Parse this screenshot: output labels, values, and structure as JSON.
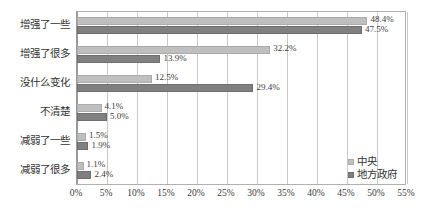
{
  "chart_data": {
    "type": "bar",
    "orientation": "horizontal",
    "title": "",
    "xlabel": "",
    "ylabel": "",
    "categories": [
      "增强了一些",
      "增强了很多",
      "没什么变化",
      "不清楚",
      "减弱了一些",
      "减弱了很多"
    ],
    "series": [
      {
        "name": "中央",
        "color": "#bfbfbf",
        "values": [
          48.4,
          32.2,
          12.5,
          4.1,
          1.5,
          1.1
        ],
        "labels": [
          "48.4%",
          "32.2%",
          "12.5%",
          "4.1%",
          "1.5%",
          "1.1%"
        ]
      },
      {
        "name": "地方政府",
        "color": "#808080",
        "values": [
          47.5,
          13.9,
          29.4,
          5.0,
          1.9,
          2.4
        ],
        "labels": [
          "47.5%",
          "13.9%",
          "29.4%",
          "5.0%",
          "1.9%",
          "2.4%"
        ]
      }
    ],
    "xlim": [
      0,
      55
    ],
    "xticks": [
      0,
      5,
      10,
      15,
      20,
      25,
      30,
      35,
      40,
      45,
      50,
      55
    ],
    "xticklabels": [
      "0%",
      "5%",
      "10%",
      "15%",
      "20%",
      "25%",
      "30%",
      "35%",
      "40%",
      "45%",
      "50%",
      "55%"
    ],
    "grid": true,
    "legend_position": "bottom-right"
  }
}
